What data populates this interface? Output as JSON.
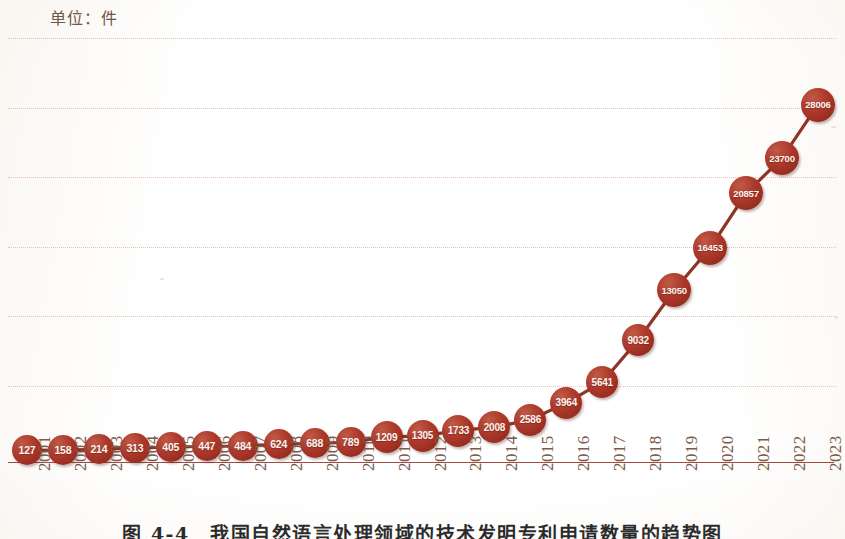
{
  "unit_label": "单位：件",
  "caption": "图 4-4　我国自然语言处理领域的技术发明专利申请数量的趋势图",
  "colors": {
    "marker": "#a8342a",
    "line": "#8f3528",
    "gridline": "#e8b5ae",
    "axis": "#9c3a2c",
    "tick_text": "#7b5a4a",
    "unit_text": "#6e5547"
  },
  "chart_data": {
    "type": "line",
    "title": "单位：件",
    "xlabel": "",
    "ylabel": "",
    "ylim": [
      0,
      30000
    ],
    "grid": true,
    "gridline_count": 6,
    "legend": null,
    "marker_style": "filled-circle-with-inline-value-label",
    "categories": [
      "2001",
      "2002",
      "2003",
      "2004",
      "2005",
      "2006",
      "2007",
      "2008",
      "2009",
      "2010",
      "2011",
      "2012",
      "2013",
      "2014",
      "2015",
      "2016",
      "2017",
      "2018",
      "2019",
      "2020",
      "2021",
      "2022",
      "2023"
    ],
    "values": [
      127,
      158,
      214,
      313,
      405,
      447,
      484,
      624,
      688,
      789,
      1209,
      1305,
      1733,
      2008,
      2586,
      3964,
      5641,
      9032,
      13050,
      16453,
      20857,
      23700,
      28006
    ],
    "points": [
      {
        "x": "2001",
        "y": 127,
        "label": "127"
      },
      {
        "x": "2002",
        "y": 158,
        "label": "158"
      },
      {
        "x": "2003",
        "y": 214,
        "label": "214"
      },
      {
        "x": "2004",
        "y": 313,
        "label": "313"
      },
      {
        "x": "2005",
        "y": 405,
        "label": "405"
      },
      {
        "x": "2006",
        "y": 447,
        "label": "447"
      },
      {
        "x": "2007",
        "y": 484,
        "label": "484"
      },
      {
        "x": "2008",
        "y": 624,
        "label": "624"
      },
      {
        "x": "2009",
        "y": 688,
        "label": "688"
      },
      {
        "x": "2010",
        "y": 789,
        "label": "789"
      },
      {
        "x": "2011",
        "y": 1209,
        "label": "1209"
      },
      {
        "x": "2012",
        "y": 1305,
        "label": "1305"
      },
      {
        "x": "2013",
        "y": 1733,
        "label": "1733"
      },
      {
        "x": "2014",
        "y": 2008,
        "label": "2008"
      },
      {
        "x": "2015",
        "y": 2586,
        "label": "2586"
      },
      {
        "x": "2016",
        "y": 3964,
        "label": "3964"
      },
      {
        "x": "2017",
        "y": 5641,
        "label": "5641"
      },
      {
        "x": "2018",
        "y": 9032,
        "label": "9032"
      },
      {
        "x": "2019",
        "y": 13050,
        "label": "13050"
      },
      {
        "x": "2020",
        "y": 16453,
        "label": "16453"
      },
      {
        "x": "2021",
        "y": 20857,
        "label": "20857"
      },
      {
        "x": "2022",
        "y": 23700,
        "label": "23700"
      },
      {
        "x": "2023",
        "y": 28006,
        "label": "28006"
      }
    ]
  }
}
